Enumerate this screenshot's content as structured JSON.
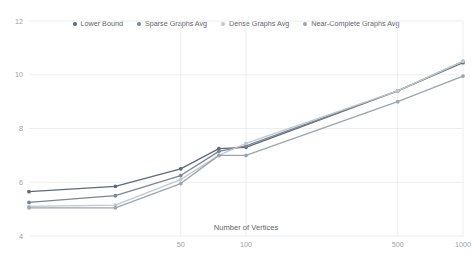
{
  "chart_data": {
    "type": "line",
    "title": "",
    "xlabel": "Number of Vertices",
    "ylabel": "",
    "xscale": "log",
    "xlim": [
      10,
      1000
    ],
    "ylim": [
      4,
      12
    ],
    "yticks": [
      4,
      6,
      8,
      10,
      12
    ],
    "xticks": [
      50,
      100,
      500,
      1000
    ],
    "xtick_labels": [
      "50",
      "100",
      "500",
      "1000"
    ],
    "ytick_labels": [
      "4",
      "6",
      "8",
      "10",
      "12"
    ],
    "grid": true,
    "legend_position": "top-center",
    "x": [
      10,
      25,
      50,
      75,
      100,
      500,
      1000
    ],
    "series": [
      {
        "name": "Lower Bound",
        "color": "#5b6b7f",
        "values": [
          5.65,
          5.85,
          6.5,
          7.25,
          7.3,
          9.4,
          10.45
        ]
      },
      {
        "name": "Sparse Graphs Avg",
        "color": "#7a8694",
        "values": [
          5.25,
          5.5,
          6.25,
          7.15,
          7.35,
          9.4,
          10.5
        ]
      },
      {
        "name": "Dense Graphs Avg",
        "color": "#c2c7cc",
        "values": [
          5.1,
          5.15,
          6.1,
          7.0,
          7.45,
          9.4,
          10.5
        ]
      },
      {
        "name": "Near-Complete Graphs Avg",
        "color": "#9aa5b1",
        "values": [
          5.05,
          5.05,
          5.95,
          7.0,
          7.0,
          9.0,
          9.95
        ]
      }
    ]
  },
  "legend": {
    "items": [
      {
        "label": "Lower Bound",
        "color": "#5b6b7f"
      },
      {
        "label": "Sparse Graphs Avg",
        "color": "#7a8694"
      },
      {
        "label": "Dense Graphs Avg",
        "color": "#c2c7cc"
      },
      {
        "label": "Near-Complete Graphs Avg",
        "color": "#9aa5b1"
      }
    ]
  },
  "axes": {
    "x_title": "Number of Vertices",
    "x_labels": [
      "50",
      "100",
      "500",
      "1000"
    ],
    "y_labels": [
      "12",
      "10",
      "8",
      "6",
      "4"
    ]
  }
}
